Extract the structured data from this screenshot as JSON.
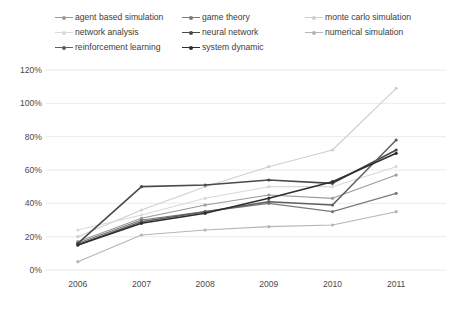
{
  "chart_data": {
    "type": "line",
    "title": "",
    "xlabel": "",
    "ylabel": "",
    "x": [
      "2006",
      "2007",
      "2008",
      "2009",
      "2010",
      "2011"
    ],
    "categories": [
      "2006",
      "2007",
      "2008",
      "2009",
      "2010",
      "2011"
    ],
    "ylim": [
      0,
      120
    ],
    "ytick_labels": [
      "0%",
      "20%",
      "40%",
      "60%",
      "80%",
      "100%",
      "120%"
    ],
    "ytick_values": [
      0,
      20,
      40,
      60,
      80,
      100,
      120
    ],
    "grid": true,
    "legend_position": "top",
    "value_suffix": "%",
    "series": [
      {
        "name": "agent based simulation",
        "color": "#9a9a9a",
        "width": 1.1,
        "values": [
          17,
          31,
          39,
          45,
          43,
          57
        ]
      },
      {
        "name": "game theory",
        "color": "#7b7b7b",
        "width": 1.2,
        "values": [
          16,
          30,
          35,
          40,
          35,
          46
        ]
      },
      {
        "name": "monte carlo simulation",
        "color": "#cfcfcf",
        "width": 1.1,
        "values": [
          20,
          36,
          50,
          62,
          72,
          109
        ]
      },
      {
        "name": "network analysis",
        "color": "#d9d9d9",
        "width": 1.1,
        "values": [
          24,
          33,
          43,
          50,
          50,
          62
        ]
      },
      {
        "name": "neural network",
        "color": "#4a4a4a",
        "width": 1.6,
        "values": [
          16,
          50,
          51,
          54,
          52,
          72
        ]
      },
      {
        "name": "numerical simulation",
        "color": "#b5b5b5",
        "width": 1.1,
        "values": [
          5,
          21,
          24,
          26,
          27,
          35
        ]
      },
      {
        "name": "reinforcement learning",
        "color": "#5e5e5e",
        "width": 1.5,
        "values": [
          15,
          29,
          35,
          41,
          39,
          78
        ]
      },
      {
        "name": "system dynamic",
        "color": "#2e2e2e",
        "width": 1.6,
        "values": [
          15,
          28,
          34,
          43,
          53,
          70
        ]
      }
    ]
  },
  "legend": {
    "rows": [
      [
        {
          "label": "agent based simulation",
          "color": "#9a9a9a",
          "left": 0
        },
        {
          "label": "game theory",
          "color": "#7b7b7b",
          "left": 127
        },
        {
          "label": "monte carlo simulation",
          "color": "#cfcfcf",
          "left": 250
        }
      ],
      [
        {
          "label": "network analysis",
          "color": "#d9d9d9",
          "left": 0
        },
        {
          "label": "neural network",
          "color": "#4a4a4a",
          "left": 127
        },
        {
          "label": "numerical simulation",
          "color": "#b5b5b5",
          "left": 250
        }
      ],
      [
        {
          "label": "reinforcement learning",
          "color": "#5e5e5e",
          "left": 0
        },
        {
          "label": "system dynamic",
          "color": "#2e2e2e",
          "left": 127
        }
      ]
    ]
  },
  "caption": ""
}
